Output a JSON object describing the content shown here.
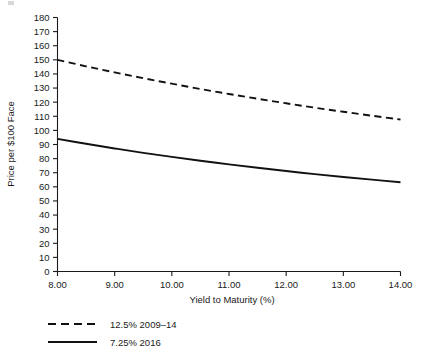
{
  "chart_data": {
    "type": "line",
    "title": "",
    "xlabel": "Yield to Maturity (%)",
    "ylabel": "Price per $100 Face",
    "xlim": [
      8.0,
      14.0
    ],
    "ylim": [
      0,
      180
    ],
    "xticks": [
      "8.00",
      "9.00",
      "10.00",
      "11.00",
      "12.00",
      "13.00",
      "14.00"
    ],
    "xtick_values": [
      8.0,
      9.0,
      10.0,
      11.0,
      12.0,
      13.0,
      14.0
    ],
    "yticks": [
      "0",
      "10",
      "20",
      "30",
      "40",
      "50",
      "60",
      "70",
      "80",
      "90",
      "100",
      "110",
      "120",
      "130",
      "140",
      "150",
      "160",
      "170",
      "180"
    ],
    "ytick_values": [
      0,
      10,
      20,
      30,
      40,
      50,
      60,
      70,
      80,
      90,
      100,
      110,
      120,
      130,
      140,
      150,
      160,
      170,
      180
    ],
    "grid": false,
    "legend_position": "below-left",
    "x": [
      8.0,
      8.5,
      9.0,
      9.5,
      10.0,
      10.5,
      11.0,
      11.5,
      12.0,
      12.5,
      13.0,
      13.5,
      14.0
    ],
    "series": [
      {
        "name": "12.5% 2009–14",
        "style": "dashed",
        "color": "#111111",
        "values": [
          150.0,
          145.4,
          141.1,
          137.0,
          133.1,
          129.3,
          125.8,
          122.4,
          119.2,
          116.1,
          113.2,
          110.4,
          107.7
        ]
      },
      {
        "name": "7.25% 2016",
        "style": "solid",
        "color": "#111111",
        "values": [
          94.0,
          90.5,
          87.2,
          84.1,
          81.2,
          78.5,
          75.9,
          73.5,
          71.2,
          69.0,
          67.0,
          65.1,
          63.3
        ]
      }
    ]
  },
  "legend": {
    "entries": [
      {
        "label": "12.5% 2009–14",
        "style": "dashed"
      },
      {
        "label": "7.25% 2016",
        "style": "solid"
      }
    ]
  }
}
